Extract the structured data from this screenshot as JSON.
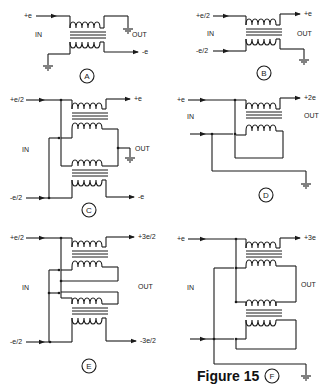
{
  "figure": {
    "caption": "Figure 15"
  },
  "panels": [
    {
      "id": "A",
      "in_label": "IN",
      "out_label": "OUT",
      "terminals": [
        "+e",
        "-e"
      ]
    },
    {
      "id": "B",
      "in_label": "IN",
      "out_label": "OUT",
      "terminals": [
        "+e/2",
        "-e/2",
        "+e"
      ]
    },
    {
      "id": "C",
      "in_label": "IN",
      "out_label": "OUT",
      "terminals": [
        "+e/2",
        "-e/2",
        "+e",
        "-e"
      ]
    },
    {
      "id": "D",
      "in_label": "IN",
      "out_label": "OUT",
      "terminals": [
        "+e",
        "+2e"
      ]
    },
    {
      "id": "E",
      "in_label": "IN",
      "out_label": "OUT",
      "terminals": [
        "+e/2",
        "-e/2",
        "+3e/2",
        "-3e/2"
      ]
    },
    {
      "id": "F",
      "in_label": "IN",
      "out_label": "OUT",
      "terminals": [
        "+e",
        "+3e"
      ]
    }
  ]
}
